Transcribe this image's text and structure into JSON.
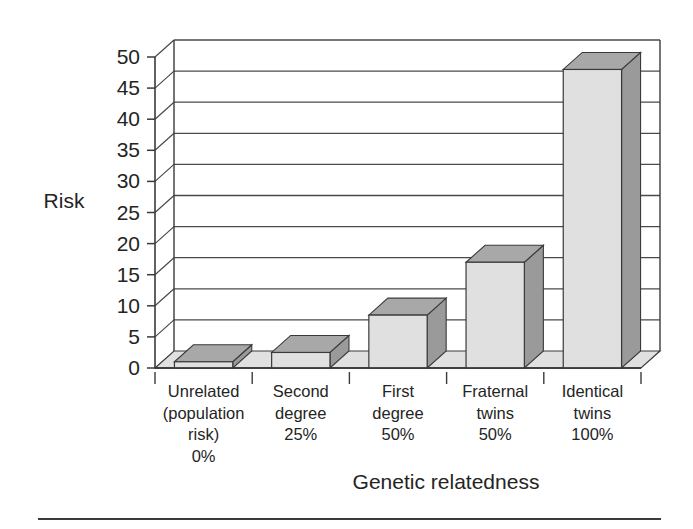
{
  "chart_data": {
    "type": "bar",
    "title": "",
    "subtitle": "",
    "xlabel": "Genetic relatedness",
    "ylabel": "Risk",
    "categories": [
      "Unrelated (population risk) 0%",
      "Second degree 25%",
      "First degree 50%",
      "Fraternal twins 50%",
      "Identical twins 100%"
    ],
    "category_lines": [
      [
        "Unrelated",
        "(population",
        "risk)",
        "0%"
      ],
      [
        "Second",
        "degree",
        "25%"
      ],
      [
        "First",
        "degree",
        "50%"
      ],
      [
        "Fraternal",
        "twins",
        "50%"
      ],
      [
        "Identical",
        "twins",
        "100%"
      ]
    ],
    "values": [
      1,
      2.5,
      8.5,
      17,
      48
    ],
    "ylim": [
      0,
      50
    ],
    "ytick_values": [
      0,
      5,
      10,
      15,
      20,
      25,
      30,
      35,
      40,
      45,
      50
    ],
    "ytick_labels": [
      "0",
      "5",
      "10",
      "15",
      "20",
      "25",
      "30",
      "35",
      "40",
      "45",
      "50"
    ],
    "ytick_step": 5,
    "grid": true,
    "grid_axis": "y",
    "legend": null,
    "legend_position": "none",
    "style": "3d-bar",
    "colors": {
      "bar_front": "#e0e0e0",
      "bar_top": "#a8a8a8",
      "bar_side": "#9a9a9a",
      "floor": "#e0e0e0",
      "outline": "#3a3a3a",
      "gridline": "#4a4a4a",
      "text": "#242424",
      "background": "#ffffff"
    }
  },
  "axis": {
    "y_title": "Risk",
    "x_title": "Genetic relatedness"
  }
}
